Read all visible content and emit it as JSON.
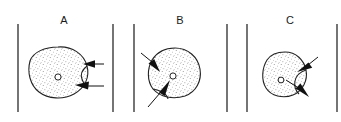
{
  "figure": {
    "title": "",
    "background_color": "#ffffff",
    "ink_color": "#1a1a1a",
    "stipple_color": "#555555",
    "width": 341,
    "height": 122,
    "panels": [
      {
        "label": "A",
        "label_x": 64,
        "label_y": 24,
        "blob_name": "stippled-cell-a",
        "nucleus": "open-circle",
        "arrows": [
          {
            "name": "arrow-a-upper",
            "description": "horizontal arrow pointing left toward blob edge, upper right",
            "direction": "left"
          },
          {
            "name": "arrow-a-lower",
            "description": "horizontal arrow pointing left toward blob edge, lower right",
            "direction": "left"
          }
        ]
      },
      {
        "label": "B",
        "label_x": 180,
        "label_y": 24,
        "blob_name": "stippled-cell-b",
        "nucleus": "open-circle",
        "arrows": [
          {
            "name": "arrow-b-upper",
            "description": "arrow pointing down-right into blob from upper left",
            "direction": "down-right"
          },
          {
            "name": "arrow-b-lower",
            "description": "arrow pointing up-right into blob from lower left",
            "direction": "up-right"
          }
        ]
      },
      {
        "label": "C",
        "label_x": 290,
        "label_y": 24,
        "blob_name": "stippled-cell-c",
        "nucleus": "open-circle",
        "arrows": [
          {
            "name": "arrow-c-upper",
            "description": "arrow pointing down-left into blob from upper right",
            "direction": "down-left"
          },
          {
            "name": "arrow-c-lower",
            "description": "arrow pointing down-right out of blob to lower right",
            "direction": "down-right"
          }
        ]
      }
    ],
    "dividers": [
      {
        "name": "divider-line-1",
        "x": 18,
        "y1": 24,
        "y2": 112
      },
      {
        "name": "divider-line-2",
        "x": 113,
        "y1": 24,
        "y2": 112
      },
      {
        "name": "divider-line-3",
        "x": 134,
        "y1": 24,
        "y2": 112
      },
      {
        "name": "divider-line-4",
        "x": 227,
        "y1": 24,
        "y2": 112
      },
      {
        "name": "divider-line-5",
        "x": 247,
        "y1": 24,
        "y2": 112
      },
      {
        "name": "divider-line-6",
        "x": 337,
        "y1": 24,
        "y2": 112
      }
    ]
  }
}
